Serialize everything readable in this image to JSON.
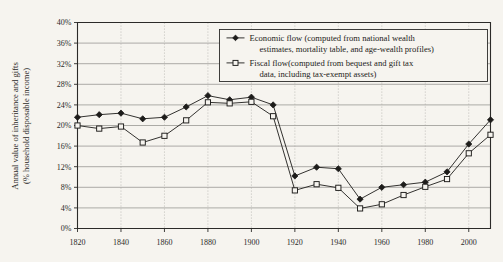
{
  "chart_data": {
    "type": "line",
    "title": "",
    "xlabel": "",
    "ylabel": "Annual value of inheritance and gifts (% household disposable income)",
    "ylabel_line1": "Annual value of inheritance and gifts",
    "ylabel_line2": "(% household disposable income)",
    "x": [
      1820,
      1830,
      1840,
      1850,
      1860,
      1870,
      1880,
      1890,
      1900,
      1910,
      1920,
      1930,
      1940,
      1950,
      1960,
      1970,
      1980,
      1990,
      2000,
      2010
    ],
    "xlim": [
      1820,
      2010
    ],
    "ylim": [
      0,
      40
    ],
    "y_tick_labels": [
      "0%",
      "4%",
      "8%",
      "12%",
      "16%",
      "20%",
      "24%",
      "28%",
      "32%",
      "36%",
      "40%"
    ],
    "y_tick_values": [
      0,
      4,
      8,
      12,
      16,
      20,
      24,
      28,
      32,
      36,
      40
    ],
    "x_tick_labels": [
      "1820",
      "1840",
      "1860",
      "1880",
      "1900",
      "1920",
      "1940",
      "1960",
      "1980",
      "2000"
    ],
    "x_tick_values": [
      1820,
      1840,
      1860,
      1880,
      1900,
      1920,
      1940,
      1960,
      1980,
      2000
    ],
    "grid": "horizontal-major-and-vertical-dotted",
    "legend_position": "top-center",
    "series": [
      {
        "name": "Economic flow (computed from national wealth estimates, mortality table, and age-wealth profiles)",
        "name_line1": "Economic flow (computed from national wealth",
        "name_line2": "estimates, mortality table, and age-wealth profiles)",
        "marker": "filled-diamond",
        "color": "#1d1c1a",
        "values": [
          21.6,
          22.1,
          22.4,
          21.3,
          21.6,
          23.6,
          25.8,
          25.0,
          25.5,
          24.0,
          10.2,
          11.9,
          11.6,
          5.7,
          8.0,
          8.5,
          9.0,
          11.0,
          16.4,
          21.1
        ]
      },
      {
        "name": "Fiscal flow (computed from bequest and gift tax data, including tax-exempt assets)",
        "name_line1": "Fiscal flow(computed from bequest and gift tax",
        "name_line2": "data, including tax-exempt assets)",
        "marker": "open-square",
        "color": "#1d1c1a",
        "values": [
          20.0,
          19.4,
          19.8,
          16.7,
          18.0,
          21.0,
          24.5,
          24.3,
          24.6,
          21.8,
          7.4,
          8.6,
          7.9,
          3.9,
          4.7,
          6.5,
          8.1,
          9.6,
          14.6,
          18.2
        ]
      }
    ]
  },
  "legend": {
    "entries": [
      {
        "marker_name": "filled-diamond-marker",
        "line1": "Economic flow (computed from national wealth",
        "line2": "estimates, mortality table, and age-wealth profiles)"
      },
      {
        "marker_name": "open-square-marker",
        "line1": "Fiscal flow(computed from bequest and gift tax",
        "line2": "data, including tax-exempt assets)"
      }
    ]
  },
  "colors": {
    "background": "#f6f4ef",
    "ink": "#1d1c1a",
    "gridline": "#8d8b86",
    "gridline_vertical": "#a9a7a2"
  }
}
